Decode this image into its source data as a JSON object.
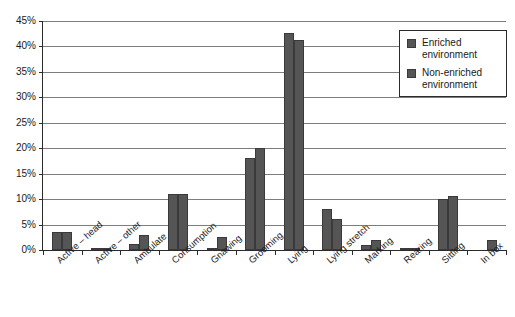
{
  "chart_data": {
    "type": "bar",
    "title": "",
    "xlabel": "",
    "ylabel": "",
    "ylim": [
      0,
      45
    ],
    "ytick_labels": [
      "0%",
      "5%",
      "10%",
      "15%",
      "20%",
      "25%",
      "30%",
      "35%",
      "40%",
      "45%"
    ],
    "ytick_values": [
      0,
      5,
      10,
      15,
      20,
      25,
      30,
      35,
      40,
      45
    ],
    "grid": true,
    "legend_position": "top-right",
    "categories": [
      "Active – head",
      "Active – other",
      "Ambulate",
      "Consumption",
      "Gnawing",
      "Grooming",
      "Lying",
      "Lying stretch",
      "Marking",
      "Rearing",
      "Sitting",
      "In box"
    ],
    "series": [
      {
        "name": "Enriched environment",
        "color": "#555555",
        "values": [
          3.6,
          0.3,
          1.2,
          11.0,
          0.3,
          18.0,
          42.6,
          8.0,
          1.0,
          0.2,
          10.0,
          0.0
        ]
      },
      {
        "name": "Non-enriched environment",
        "color": "#555555",
        "values": [
          3.5,
          0.2,
          3.0,
          11.1,
          2.6,
          20.0,
          41.2,
          6.0,
          2.0,
          0.2,
          10.7,
          2.0
        ]
      }
    ]
  },
  "legend": {
    "items": [
      {
        "label": "Enriched environment"
      },
      {
        "label": "Non-enriched environment"
      }
    ]
  }
}
